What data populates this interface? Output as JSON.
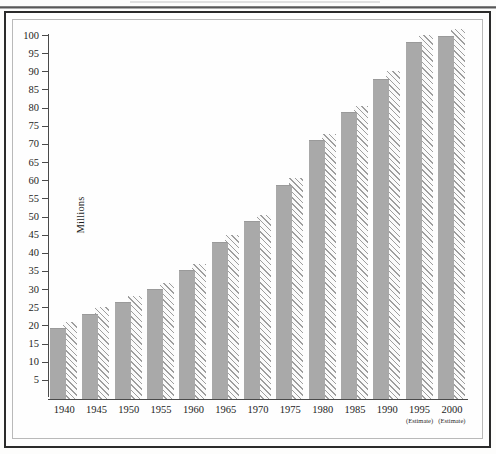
{
  "chart_data": {
    "type": "bar",
    "title": "",
    "subtitle": "",
    "xlabel": "",
    "ylabel": "Millions",
    "ylim": [
      0,
      100
    ],
    "ytick_step": 5,
    "grid": false,
    "legend_position": "none",
    "categories": [
      "1940",
      "1945",
      "1950",
      "1955",
      "1960",
      "1965",
      "1970",
      "1975",
      "1980",
      "1985",
      "1990",
      "1995",
      "2000"
    ],
    "category_notes": [
      "",
      "",
      "",
      "",
      "",
      "",
      "",
      "",
      "",
      "",
      "",
      "(Estimate)",
      "(Estimate)"
    ],
    "yticks": [
      5,
      10,
      15,
      20,
      25,
      30,
      35,
      40,
      45,
      50,
      55,
      60,
      65,
      70,
      75,
      80,
      85,
      90,
      95,
      100
    ],
    "ytick_labels": [
      "5",
      "10",
      "15",
      "20",
      "25",
      "30",
      "35",
      "40",
      "45",
      "50",
      "55",
      "60",
      "65",
      "70",
      "75",
      "80",
      "85",
      "90",
      "95",
      "100"
    ],
    "series": [
      {
        "name": "solid-bar",
        "style": "solid",
        "color": "#a9a9a9",
        "values": [
          19.4,
          23.2,
          26.4,
          29.9,
          35.3,
          43.1,
          48.7,
          58.8,
          71.0,
          78.8,
          88.0,
          98.0,
          99.6
        ]
      },
      {
        "name": "hatched-bar",
        "style": "diagonal-hatch",
        "color": "#9e9e9e",
        "values": [
          21.3,
          25.3,
          28.4,
          31.9,
          37.3,
          45.1,
          50.7,
          60.8,
          73.0,
          80.8,
          90.3,
          100.3,
          101.9
        ]
      }
    ]
  },
  "axis": {
    "y_label": "Millions"
  }
}
